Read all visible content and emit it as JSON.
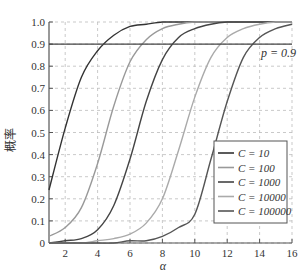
{
  "chart_data": {
    "type": "line",
    "title": "",
    "xlabel": "α",
    "ylabel": "概率",
    "xlim": [
      1,
      16
    ],
    "ylim": [
      0,
      1.0
    ],
    "xticks": [
      2,
      4,
      6,
      8,
      10,
      12,
      14,
      16
    ],
    "yticks": [
      0,
      0.1,
      0.2,
      0.3,
      0.4,
      0.5,
      0.6,
      0.7,
      0.8,
      0.9,
      1.0
    ],
    "ytick_labels": [
      "0",
      "0.1",
      "0.2",
      "0.3",
      "0.4",
      "0.5",
      "0.6",
      "0.7",
      "0.8",
      "0.9",
      "1.0"
    ],
    "grid": true,
    "legend_position": "lower right",
    "annotations": [
      {
        "text": "p = 0.9",
        "x": 15.2,
        "y": 0.88
      }
    ],
    "reference_line": {
      "y": 0.9,
      "label": "p = 0.9"
    },
    "x": [
      1,
      2,
      3,
      4,
      5,
      6,
      7,
      8,
      9,
      10,
      11,
      12,
      13,
      14,
      15,
      16
    ],
    "series": [
      {
        "name": "C = 10",
        "color": "#333333",
        "values": [
          0.24,
          0.52,
          0.75,
          0.87,
          0.94,
          0.98,
          0.99,
          1.0,
          1.0,
          1.0,
          1.0,
          1.0,
          1.0,
          1.0,
          1.0,
          1.0
        ]
      },
      {
        "name": "C = 100",
        "color": "#999999",
        "values": [
          0.03,
          0.07,
          0.16,
          0.36,
          0.62,
          0.82,
          0.92,
          0.97,
          0.99,
          1.0,
          1.0,
          1.0,
          1.0,
          1.0,
          1.0,
          1.0
        ]
      },
      {
        "name": "C = 1000",
        "color": "#444444",
        "values": [
          0.0,
          0.01,
          0.02,
          0.06,
          0.17,
          0.38,
          0.64,
          0.83,
          0.93,
          0.97,
          0.99,
          1.0,
          1.0,
          1.0,
          1.0,
          1.0
        ]
      },
      {
        "name": "C = 10000",
        "color": "#aaaaaa",
        "values": [
          0.0,
          0.0,
          0.0,
          0.01,
          0.02,
          0.04,
          0.09,
          0.2,
          0.42,
          0.66,
          0.84,
          0.93,
          0.97,
          0.99,
          1.0,
          1.0
        ]
      },
      {
        "name": "C = 100000",
        "color": "#555555",
        "values": [
          0.0,
          0.0,
          0.0,
          0.0,
          0.0,
          0.01,
          0.01,
          0.03,
          0.07,
          0.13,
          0.38,
          0.64,
          0.84,
          0.93,
          0.97,
          0.99
        ]
      }
    ]
  }
}
